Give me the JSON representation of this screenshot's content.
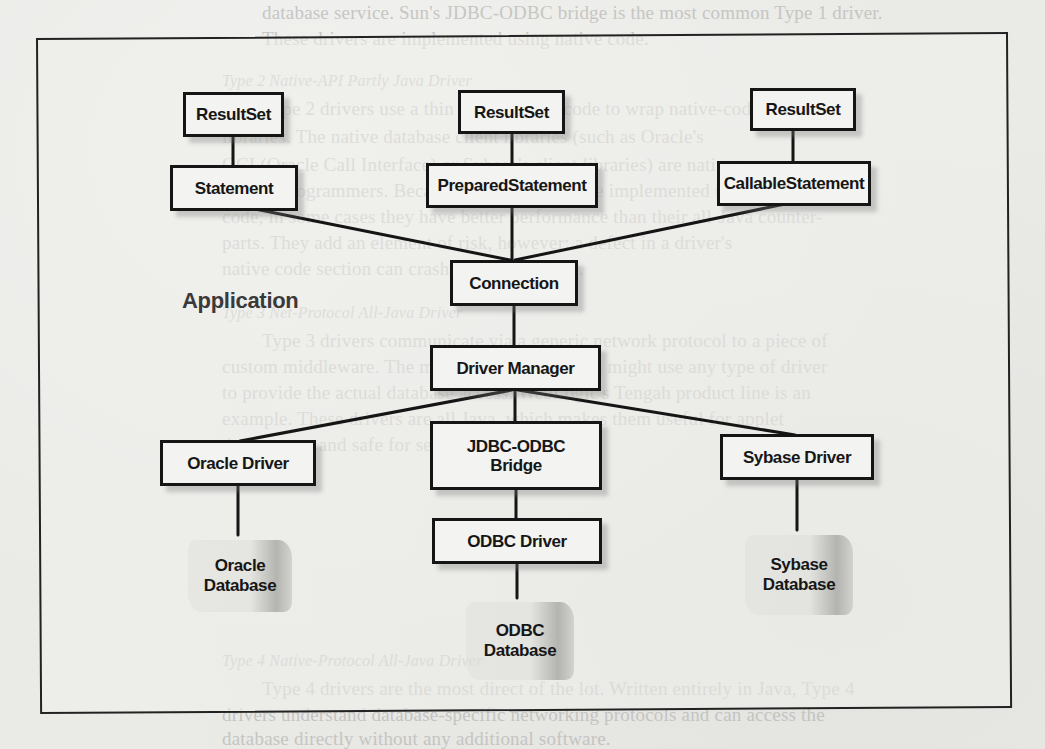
{
  "background_text": {
    "lines": [
      {
        "text": "database service. Sun's JDBC-ODBC bridge is the most common Type 1 driver.",
        "x": 262,
        "y": 2,
        "italic": false
      },
      {
        "text": "These drivers are implemented using native code.",
        "x": 262,
        "y": 28,
        "italic": false
      },
      {
        "text": "Type 2 Native-API Partly Java Driver",
        "x": 222,
        "y": 72,
        "italic": true
      },
      {
        "text": "Type 2 drivers use a thin layer of Java code to wrap native-code",
        "x": 262,
        "y": 98,
        "italic": false
      },
      {
        "text": "libraries. The native database client libraries (such as Oracle's",
        "x": 222,
        "y": 126,
        "italic": false
      },
      {
        "text": "OCI (Oracle Call Interface) or Sybase's client libraries) are native to",
        "x": 222,
        "y": 154,
        "italic": false
      },
      {
        "text": "C/C++ programmers. Because Type 2 drivers are implemented using native",
        "x": 222,
        "y": 180,
        "italic": false
      },
      {
        "text": "code, in some cases they have better performance than their all-Java counter-",
        "x": 222,
        "y": 206,
        "italic": false
      },
      {
        "text": "parts. They add an element of risk, however: a defect in a driver's",
        "x": 222,
        "y": 232,
        "italic": false
      },
      {
        "text": "native code section can crash the entire server.",
        "x": 222,
        "y": 258,
        "italic": false
      },
      {
        "text": "Type 3 Net-Protocol All-Java Driver",
        "x": 222,
        "y": 304,
        "italic": true
      },
      {
        "text": "Type 3 drivers communicate via a generic network protocol to a piece of",
        "x": 262,
        "y": 330,
        "italic": false
      },
      {
        "text": "custom middleware. The middleware component might use any type of driver",
        "x": 222,
        "y": 356,
        "italic": false
      },
      {
        "text": "to provide the actual database access. WebLogic's Tengah product line is an",
        "x": 222,
        "y": 382,
        "italic": false
      },
      {
        "text": "example. These drivers are all Java, which makes them useful for applet",
        "x": 222,
        "y": 408,
        "italic": false
      },
      {
        "text": "deployment and safe for servlet deployment.",
        "x": 222,
        "y": 434,
        "italic": false
      },
      {
        "text": "Type 4 Native-Protocol All-Java Driver",
        "x": 222,
        "y": 480,
        "italic": true
      },
      {
        "text": "Type 4 drivers are the most direct of the lot. Written entirely in Java, Type 4",
        "x": 262,
        "y": 506,
        "italic": false
      },
      {
        "text": "drivers understand database-specific networking protocols and can access the",
        "x": 222,
        "y": 532,
        "italic": false
      },
      {
        "text": "database directly without any additional software.",
        "x": 222,
        "y": 558,
        "italic": false
      }
    ]
  },
  "diagram": {
    "title_label": "Application",
    "nodes": {
      "resultset_left": "ResultSet",
      "resultset_middle": "ResultSet",
      "resultset_right": "ResultSet",
      "statement": "Statement",
      "prepared_statement": "PreparedStatement",
      "callable_statement": "CallableStatement",
      "connection": "Connection",
      "driver_manager": "Driver Manager",
      "oracle_driver": "Oracle Driver",
      "jdbc_odbc_bridge_line1": "JDBC-ODBC",
      "jdbc_odbc_bridge_line2": "Bridge",
      "sybase_driver": "Sybase Driver",
      "odbc_driver": "ODBC Driver"
    },
    "databases": {
      "oracle_line1": "Oracle",
      "oracle_line2": "Database",
      "sybase_line1": "Sybase",
      "sybase_line2": "Database",
      "odbc_line1": "ODBC",
      "odbc_line2": "Database"
    },
    "edges": [
      [
        "ResultSet",
        "Statement"
      ],
      [
        "ResultSet",
        "PreparedStatement"
      ],
      [
        "ResultSet",
        "CallableStatement"
      ],
      [
        "Statement",
        "Connection"
      ],
      [
        "PreparedStatement",
        "Connection"
      ],
      [
        "CallableStatement",
        "Connection"
      ],
      [
        "Connection",
        "Driver Manager"
      ],
      [
        "Driver Manager",
        "Oracle Driver"
      ],
      [
        "Driver Manager",
        "JDBC-ODBC Bridge"
      ],
      [
        "Driver Manager",
        "Sybase Driver"
      ],
      [
        "Oracle Driver",
        "Oracle Database"
      ],
      [
        "JDBC-ODBC Bridge",
        "ODBC Driver"
      ],
      [
        "ODBC Driver",
        "ODBC Database"
      ],
      [
        "Sybase Driver",
        "Sybase Database"
      ]
    ],
    "colors": {
      "ink": "#151515",
      "paper": "#eaeae7",
      "bleed_text": "#b9b9b5"
    }
  }
}
